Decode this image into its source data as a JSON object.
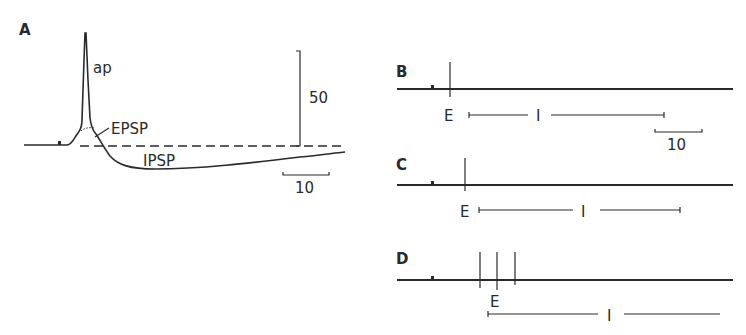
{
  "figure": {
    "panels": {
      "A": {
        "label": "A",
        "trace_labels": {
          "ap": "ap",
          "epsp": "EPSP",
          "ipsp": "IPSP"
        },
        "scale_bars": {
          "vertical": "50",
          "horizontal": "10"
        }
      },
      "B": {
        "label": "B",
        "excitation_label": "E",
        "inhibition_label": "I",
        "scale_bar": "10",
        "stimulus_count": 1
      },
      "C": {
        "label": "C",
        "excitation_label": "E",
        "inhibition_label": "I",
        "stimulus_count": 1
      },
      "D": {
        "label": "D",
        "excitation_label": "E",
        "inhibition_label": "I",
        "stimulus_count": 3
      }
    },
    "colors": {
      "ink": "#2a2a2a",
      "background": "#ffffff"
    }
  }
}
